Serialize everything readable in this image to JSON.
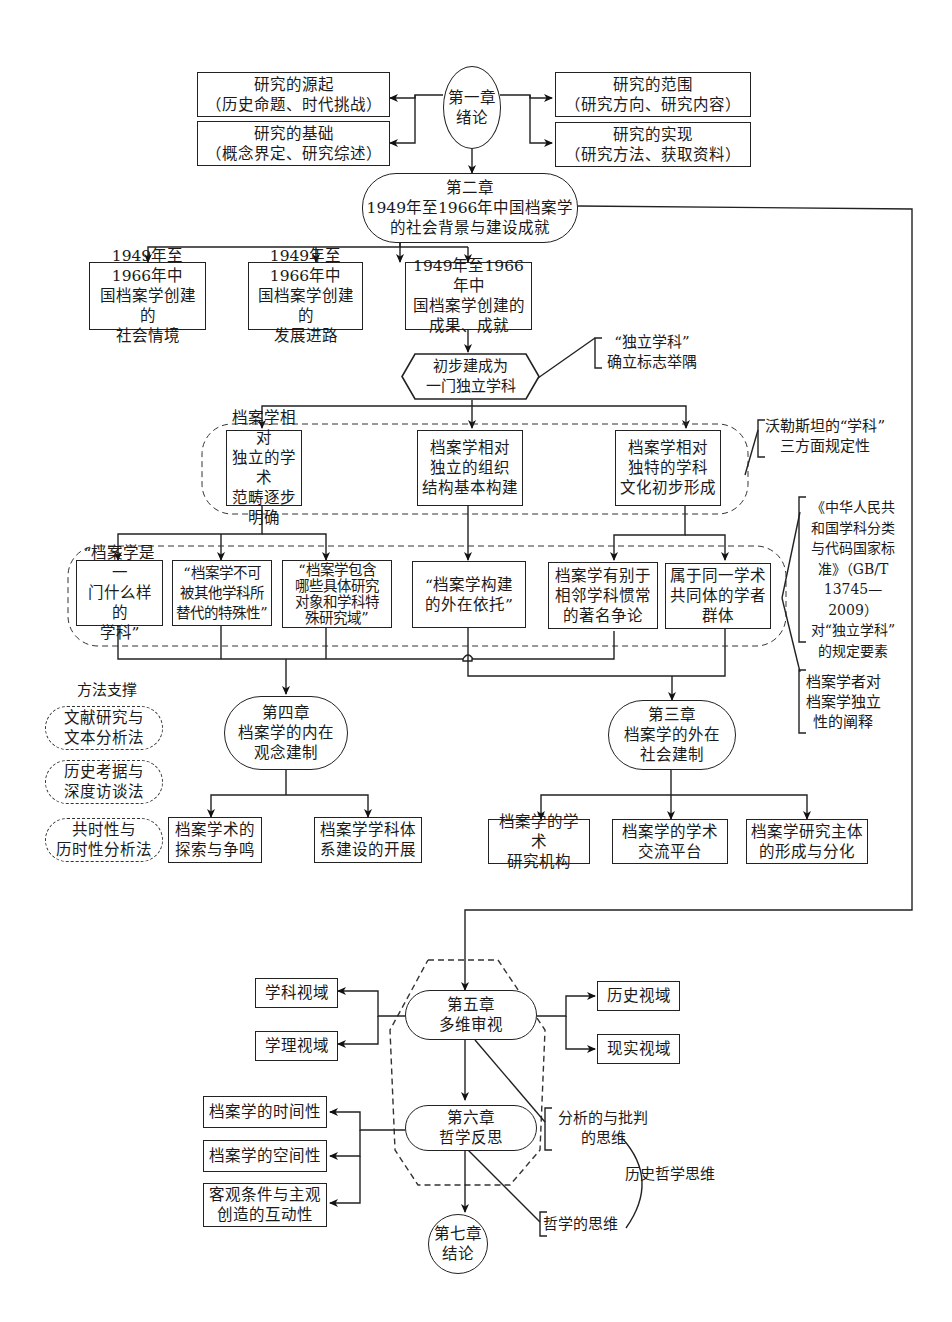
{
  "diagram": {
    "type": "flowchart",
    "chapter1": {
      "title": "第一章\n绪论",
      "left": [
        {
          "title": "研究的源起",
          "detail": "（历史命题、时代挑战）"
        },
        {
          "title": "研究的基础",
          "detail": "（概念界定、研究综述）"
        }
      ],
      "right": [
        {
          "title": "研究的范围",
          "detail": "（研究方向、研究内容）"
        },
        {
          "title": "研究的实现",
          "detail": "（研究方法、获取资料）"
        }
      ]
    },
    "chapter2": {
      "title": "第二章\n1949年至1966年中国档案学\n的社会背景与建设成就",
      "children": [
        "1949年至1966年中\n国档案学创建的\n社会情境",
        "1949年至1966年中\n国档案学创建的\n发展进路",
        "1949年至1966年中\n国档案学创建的\n成果、成就"
      ]
    },
    "independent_discipline": {
      "label": "初步建成为\n一门独立学科",
      "note": "“独立学科”\n确立标志举隅"
    },
    "three_aspects": {
      "items": [
        "档案学相对\n独立的学术\n范畴逐步明确",
        "档案学相对\n独立的组织\n结构基本构建",
        "档案学相对\n独特的学科\n文化初步形成"
      ],
      "note": "沃勒斯坦的“学科”\n三方面规定性"
    },
    "six_elements": {
      "items": [
        "“档案学是一\n门什么样的\n学科”",
        "“档案学不可\n被其他学科所\n替代的特殊性”",
        "“档案学包含\n哪些具体研究\n对象和学科特\n殊研究域”",
        "“档案学构建\n的外在依托”",
        "档案学有别于\n相邻学科惯常\n的著名争论",
        "属于同一学术\n共同体的学者\n群体"
      ],
      "note_standard": "《中华人民共\n和国学科分类\n与代码国家标\n准》（GB/T\n13745—2009）\n对“独立学科”\n的规定要素",
      "note_scholars": "档案学者对\n档案学独立\n性的阐释"
    },
    "methods": {
      "heading": "方法支撑",
      "items": [
        "文献研究与\n文本分析法",
        "历史考据与\n深度访谈法",
        "共时性与\n历时性分析法"
      ]
    },
    "chapter4": {
      "title": "第四章\n档案学的内在\n观念建制",
      "children": [
        "档案学术的\n探索与争鸣",
        "档案学学科体\n系建设的开展"
      ]
    },
    "chapter3": {
      "title": "第三章\n档案学的外在\n社会建制",
      "children": [
        "档案学的学术\n研究机构",
        "档案学的学术\n交流平台",
        "档案学研究主体\n的形成与分化"
      ]
    },
    "chapter5": {
      "title": "第五章\n多维审视",
      "left": [
        "学科视域",
        "学理视域"
      ],
      "right": [
        "历史视域",
        "现实视域"
      ]
    },
    "chapter6": {
      "title": "第六章\n哲学反思",
      "left": [
        "档案学的时间性",
        "档案学的空间性",
        "客观条件与主观\n创造的互动性"
      ],
      "thinking": [
        "分析的与批判\n的思维",
        "哲学的思维"
      ],
      "thinking_group": "历史哲学思维"
    },
    "chapter7": {
      "title": "第七章\n结论"
    }
  }
}
